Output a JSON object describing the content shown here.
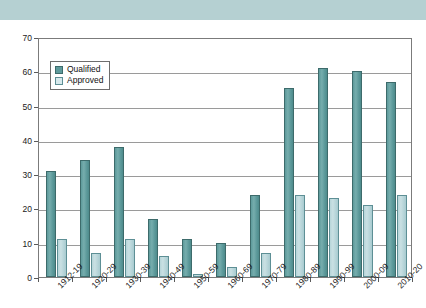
{
  "header": {
    "title": "",
    "band_color": "#b5d0d2"
  },
  "chart_data": {
    "type": "bar",
    "title": "",
    "xlabel": "",
    "ylabel": "",
    "ylim": [
      0,
      70
    ],
    "yticks": [
      0,
      10,
      20,
      30,
      40,
      50,
      60,
      70
    ],
    "grid": true,
    "legend_position": "top-left",
    "categories": [
      "1912-19",
      "1920-29",
      "1930-39",
      "1940-49",
      "1950-59",
      "1960-69",
      "1970-79",
      "1980-89",
      "1990-99",
      "2000-09",
      "2010-20"
    ],
    "series": [
      {
        "name": "Qualified",
        "color": "#5d9a9b",
        "values": [
          31,
          34,
          38,
          17,
          11,
          10,
          24,
          55,
          61,
          60,
          57
        ]
      },
      {
        "name": "Approved",
        "color": "#c3dde1",
        "values": [
          11,
          7,
          11,
          6,
          1,
          3,
          7,
          24,
          23,
          21,
          24
        ]
      }
    ]
  }
}
